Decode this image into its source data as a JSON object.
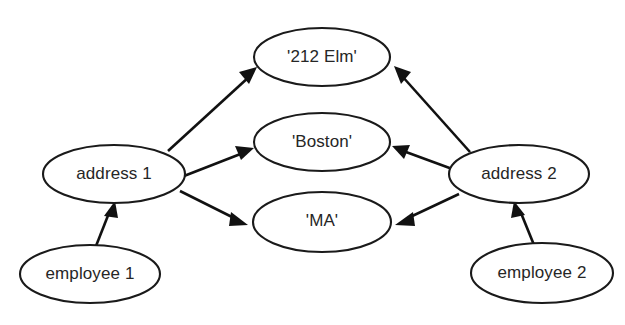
{
  "diagram": {
    "background_color": "#ffffff",
    "stroke_color": "#111111",
    "text_color": "#262626",
    "nodes": [
      {
        "id": "elm",
        "label": "'212 Elm'",
        "type": "value-node",
        "cx": 322,
        "cy": 57,
        "rx": 68,
        "ry": 29
      },
      {
        "id": "boston",
        "label": "'Boston'",
        "type": "value-node",
        "cx": 322,
        "cy": 142,
        "rx": 68,
        "ry": 29
      },
      {
        "id": "ma",
        "label": "'MA'",
        "type": "value-node",
        "cx": 322,
        "cy": 222,
        "rx": 69,
        "ry": 30
      },
      {
        "id": "address1",
        "label": "address 1",
        "type": "object-node",
        "cx": 114,
        "cy": 174,
        "rx": 71,
        "ry": 29
      },
      {
        "id": "address2",
        "label": "address 2",
        "type": "object-node",
        "cx": 519,
        "cy": 174,
        "rx": 70,
        "ry": 29
      },
      {
        "id": "employee1",
        "label": "employee 1",
        "type": "object-node",
        "cx": 90,
        "cy": 274,
        "rx": 70,
        "ry": 29
      },
      {
        "id": "employee2",
        "label": "employee 2",
        "type": "object-node",
        "cx": 542,
        "cy": 273,
        "rx": 71,
        "ry": 30
      }
    ],
    "edges": [
      {
        "id": "a1-elm",
        "from": "address1",
        "to": "elm",
        "label": ""
      },
      {
        "id": "a1-boston",
        "from": "address1",
        "to": "boston",
        "label": ""
      },
      {
        "id": "a1-ma",
        "from": "address1",
        "to": "ma",
        "label": ""
      },
      {
        "id": "a2-elm",
        "from": "address2",
        "to": "elm",
        "label": ""
      },
      {
        "id": "a2-boston",
        "from": "address2",
        "to": "boston",
        "label": ""
      },
      {
        "id": "a2-ma",
        "from": "address2",
        "to": "ma",
        "label": ""
      },
      {
        "id": "e1-a1",
        "from": "employee1",
        "to": "address1",
        "label": ""
      },
      {
        "id": "e2-a2",
        "from": "employee2",
        "to": "address2",
        "label": ""
      }
    ]
  }
}
